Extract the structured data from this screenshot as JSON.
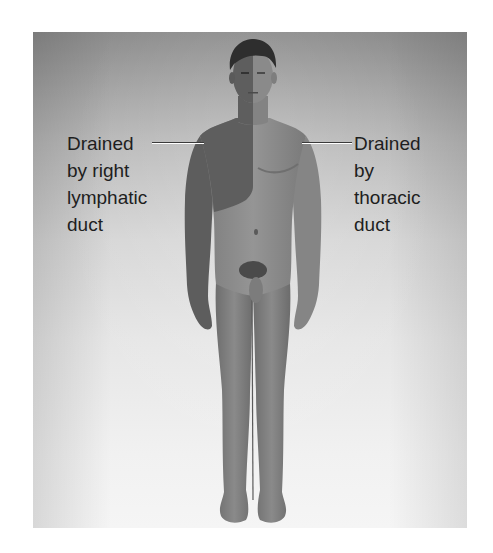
{
  "figure": {
    "colors": {
      "background_top": "#8c8c8c",
      "background_bottom": "#f5f5f5",
      "body_tone": "#8e8e8e",
      "right_lymphatic_region_tone": "#5e5e5e",
      "hair": "#2e2e2e"
    }
  },
  "labels": {
    "left": {
      "lines": [
        "Drained",
        "by right",
        "lymphatic",
        "duct"
      ]
    },
    "right": {
      "lines": [
        "Drained",
        "by",
        "thoracic",
        "duct"
      ]
    }
  }
}
